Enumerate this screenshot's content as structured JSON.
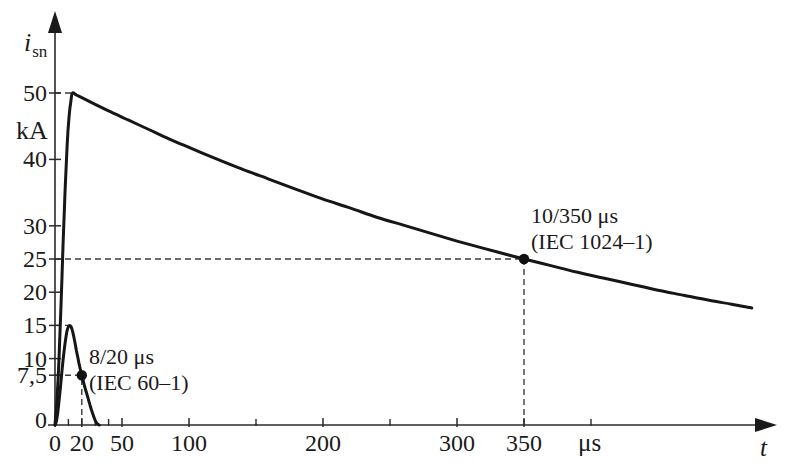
{
  "axis_labels": {
    "y_symbol": "i",
    "y_symbol_sub": "sn",
    "y_unit": "kA",
    "x_unit": "μs",
    "x_symbol": "t"
  },
  "chart_data": {
    "type": "line",
    "title": "",
    "xlabel": "t (μs)",
    "ylabel": "i_sn (kA)",
    "xlim": [
      0,
      535
    ],
    "ylim": [
      0,
      61
    ],
    "grid": false,
    "legend_position": "none",
    "colors": {
      "ink": "#1a1a1a",
      "curve": "#161616",
      "dash": "#3c3c3c",
      "paper": "#ffffff"
    },
    "x_ticks": [
      {
        "t": 0,
        "label": "0"
      },
      {
        "t": 20,
        "label": "20"
      },
      {
        "t": 50,
        "label": "50"
      },
      {
        "t": 100,
        "label": "100"
      },
      {
        "t": 200,
        "label": "200"
      },
      {
        "t": 300,
        "label": "300"
      },
      {
        "t": 350,
        "label": "350"
      }
    ],
    "x_minor_ticks": [
      10,
      30,
      40,
      150,
      250,
      400
    ],
    "y_ticks": [
      {
        "v": 0,
        "label": "0"
      },
      {
        "v": 7.5,
        "label": "7,5"
      },
      {
        "v": 10,
        "label": "10"
      },
      {
        "v": 15,
        "label": "15"
      },
      {
        "v": 20,
        "label": "20"
      },
      {
        "v": 25,
        "label": "25"
      },
      {
        "v": 30,
        "label": "30"
      },
      {
        "v": 40,
        "label": "40"
      },
      {
        "v": 50,
        "label": "50"
      }
    ],
    "series": [
      {
        "name": "10/350 μs (IEC 1024–1)",
        "peak_kA": 50,
        "half_value_time_us": 350,
        "points": [
          [
            0,
            0
          ],
          [
            1.5,
            4
          ],
          [
            3,
            10
          ],
          [
            4.5,
            18
          ],
          [
            6,
            27
          ],
          [
            7.5,
            35
          ],
          [
            9,
            42
          ],
          [
            10.5,
            46.5
          ],
          [
            12,
            49
          ],
          [
            13,
            50
          ],
          [
            16,
            49.7
          ],
          [
            20,
            49.3
          ],
          [
            30,
            48.3
          ],
          [
            40,
            47.3
          ],
          [
            55,
            45.9
          ],
          [
            70,
            44.5
          ],
          [
            85,
            43.1
          ],
          [
            100,
            41.8
          ],
          [
            120,
            40.1
          ],
          [
            140,
            38.5
          ],
          [
            160,
            37.0
          ],
          [
            180,
            35.5
          ],
          [
            200,
            34.0
          ],
          [
            220,
            32.7
          ],
          [
            240,
            31.3
          ],
          [
            260,
            30.1
          ],
          [
            280,
            28.9
          ],
          [
            300,
            27.7
          ],
          [
            320,
            26.6
          ],
          [
            335,
            25.8
          ],
          [
            350,
            25.0
          ],
          [
            370,
            24.0
          ],
          [
            390,
            23.0
          ],
          [
            410,
            22.1
          ],
          [
            430,
            21.2
          ],
          [
            450,
            20.3
          ],
          [
            470,
            19.5
          ],
          [
            490,
            18.7
          ],
          [
            505,
            18.2
          ],
          [
            520,
            17.6
          ]
        ]
      },
      {
        "name": "8/20 μs (IEC 60–1)",
        "peak_kA": 15,
        "points": [
          [
            0,
            0
          ],
          [
            1,
            0.5
          ],
          [
            2,
            1.8
          ],
          [
            3,
            3.6
          ],
          [
            4,
            5.6
          ],
          [
            5,
            7.7
          ],
          [
            6,
            9.7
          ],
          [
            7,
            11.5
          ],
          [
            8,
            13
          ],
          [
            9,
            14.2
          ],
          [
            10,
            14.8
          ],
          [
            11,
            15
          ],
          [
            12,
            14.8
          ],
          [
            13,
            14.2
          ],
          [
            14,
            13.3
          ],
          [
            15,
            12.3
          ],
          [
            16,
            11.2
          ],
          [
            17,
            10.2
          ],
          [
            18,
            9.2
          ],
          [
            19,
            8.3
          ],
          [
            20,
            7.5
          ],
          [
            21,
            6.7
          ],
          [
            22,
            5.9
          ],
          [
            23,
            5.2
          ],
          [
            24,
            4.5
          ],
          [
            25,
            3.8
          ],
          [
            26,
            3.1
          ],
          [
            27,
            2.4
          ],
          [
            28,
            1.8
          ],
          [
            29,
            1.2
          ],
          [
            30,
            0.7
          ],
          [
            31,
            0.35
          ],
          [
            32,
            0.12
          ],
          [
            33,
            0
          ]
        ]
      }
    ],
    "markers": [
      {
        "t": 350,
        "i": 25,
        "label_line1": "10/350 μs",
        "label_line2": "(IEC 1024–1)"
      },
      {
        "t": 20,
        "i": 7.5,
        "label_line1": "8/20 μs",
        "label_line2": "(IEC 60–1)"
      }
    ],
    "guides": [
      {
        "axis": "h",
        "at": 25,
        "from": 0,
        "to": 350
      },
      {
        "axis": "v",
        "at": 350,
        "from": 0,
        "to": 25
      },
      {
        "axis": "v",
        "at": 20,
        "from": 0,
        "to": 7.5
      },
      {
        "axis": "h",
        "at": 50,
        "from": 0,
        "to": 13
      },
      {
        "axis": "h",
        "at": 15,
        "from": 0,
        "to": 10
      },
      {
        "axis": "h",
        "at": 7.5,
        "from": 0,
        "to": 18
      }
    ]
  }
}
